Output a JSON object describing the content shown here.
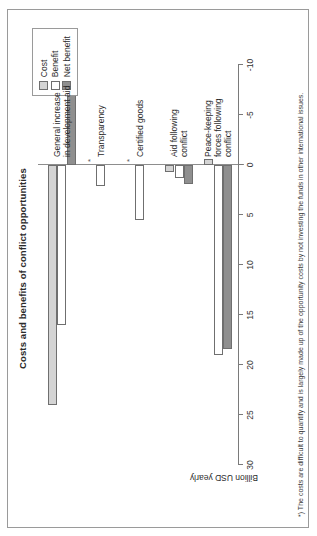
{
  "chart_data": {
    "type": "bar",
    "orientation": "horizontal",
    "title": "Costs and benefits of conflict opportunities",
    "xlabel": "",
    "ylabel": "Billion USD yearly",
    "value_axis_label": "Billion USD yearly",
    "axis_range": [
      30,
      -10
    ],
    "tick_labels": [
      "30",
      "25",
      "20",
      "15",
      "10",
      "5",
      "0",
      "-5",
      "-10"
    ],
    "tick_values": [
      30,
      25,
      20,
      15,
      10,
      5,
      0,
      -5,
      -10
    ],
    "grid": false,
    "legend_position": "top-right",
    "categories": [
      "General increase\nin development aid",
      "Transparency",
      "Certified goods",
      "Aid following\nconflict",
      "Peace-keeping\nforces following\nconflict"
    ],
    "series": [
      {
        "name": "Cost",
        "color": "#d4d4d4",
        "values": [
          24,
          0,
          0,
          0.7,
          -0.6
        ]
      },
      {
        "name": "Benefit",
        "color": "#ffffff",
        "values": [
          16,
          2.1,
          5.5,
          1.3,
          19
        ]
      },
      {
        "name": "Net benefit",
        "color": "#8f8f8f",
        "values": [
          -8,
          0,
          0,
          1.9,
          18.4
        ]
      }
    ],
    "annotations": [
      {
        "category": "Transparency",
        "series": "Cost",
        "marker": "*"
      },
      {
        "category": "Certified goods",
        "series": "Cost",
        "marker": "*"
      }
    ],
    "footnote": "*) The costs are difficult to quantify and is largely made up of the opportunity costs by not investing the funds in other international issues."
  },
  "legend": {
    "items": [
      {
        "label": "Cost",
        "key": "cost"
      },
      {
        "label": "Benefit",
        "key": "benefit"
      },
      {
        "label": "Net benefit",
        "key": "net"
      }
    ]
  }
}
